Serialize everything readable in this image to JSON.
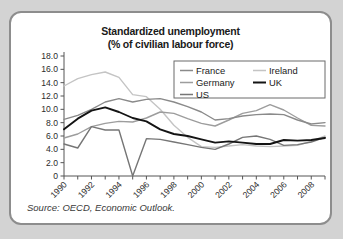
{
  "figure": {
    "title_line1": "Standardized unemployment",
    "title_line2": "(% of civilian labour force)",
    "source": "Source: OECD, Economic Outlook."
  },
  "legend": {
    "position": "top-right-inside",
    "entries": [
      {
        "label": "France",
        "color": "#8a8a8a"
      },
      {
        "label": "Ireland",
        "color": "#c4c4c4"
      },
      {
        "label": "Germany",
        "color": "#9d9d9d"
      },
      {
        "label": "UK",
        "color": "#141414"
      },
      {
        "label": "US",
        "color": "#767676"
      }
    ]
  },
  "chart_data": {
    "type": "line",
    "title": "Standardized unemployment (% of civilian labour force)",
    "xlabel": "",
    "ylabel": "",
    "grid": false,
    "legend_position": "upper right",
    "x": [
      1990,
      1991,
      1992,
      1993,
      1994,
      1995,
      1996,
      1997,
      1998,
      1999,
      2000,
      2001,
      2002,
      2003,
      2004,
      2005,
      2006,
      2007,
      2008,
      2009
    ],
    "xlim": [
      1990,
      2009
    ],
    "ylim": [
      0,
      18
    ],
    "ytick_labels": [
      "0",
      "2.0",
      "4.0",
      "6.0",
      "8.0",
      "10.0",
      "12.0",
      "14.0",
      "16.0",
      "18.0"
    ],
    "ytick_values": [
      0,
      2,
      4,
      6,
      8,
      10,
      12,
      14,
      16,
      18
    ],
    "xtick_labels": [
      "1990",
      "1992",
      "1994",
      "1996",
      "1998",
      "2000",
      "2002",
      "2004",
      "2006",
      "2008"
    ],
    "xtick_values": [
      1990,
      1992,
      1994,
      1996,
      1998,
      2000,
      2002,
      2004,
      2006,
      2008
    ],
    "series": [
      {
        "name": "France",
        "color": "#8a8a8a",
        "width": 1.4,
        "values": [
          8.5,
          9.1,
          10.0,
          11.1,
          11.6,
          11.1,
          11.5,
          11.6,
          11.1,
          10.4,
          9.6,
          8.4,
          8.6,
          9.0,
          9.2,
          9.3,
          9.2,
          8.4,
          7.8,
          8.0
        ]
      },
      {
        "name": "Ireland",
        "color": "#c4c4c4",
        "width": 1.4,
        "values": [
          13.5,
          14.6,
          15.2,
          15.6,
          14.8,
          12.2,
          11.9,
          10.0,
          7.6,
          5.8,
          4.4,
          4.3,
          4.5,
          4.7,
          4.5,
          4.4,
          4.5,
          4.6,
          5.2,
          6.0
        ]
      },
      {
        "name": "Germany",
        "color": "#9d9d9d",
        "width": 1.4,
        "values": [
          5.7,
          6.3,
          7.4,
          7.9,
          8.2,
          8.1,
          8.7,
          9.6,
          9.4,
          8.6,
          7.9,
          7.5,
          8.4,
          9.4,
          9.8,
          10.7,
          9.9,
          8.7,
          7.6,
          7.5
        ]
      },
      {
        "name": "UK",
        "color": "#141414",
        "width": 1.9,
        "values": [
          7.0,
          8.6,
          9.8,
          10.3,
          9.6,
          8.7,
          8.2,
          7.0,
          6.3,
          6.0,
          5.5,
          5.0,
          5.2,
          5.0,
          4.8,
          4.8,
          5.4,
          5.3,
          5.4,
          5.7
        ]
      },
      {
        "name": "US",
        "color": "#767676",
        "width": 1.4,
        "values": [
          4.8,
          4.2,
          7.4,
          6.9,
          6.9,
          0.0,
          5.6,
          5.5,
          5.1,
          4.7,
          4.3,
          4.0,
          4.8,
          5.8,
          6.0,
          5.5,
          4.6,
          4.7,
          5.1,
          5.8
        ]
      }
    ]
  }
}
